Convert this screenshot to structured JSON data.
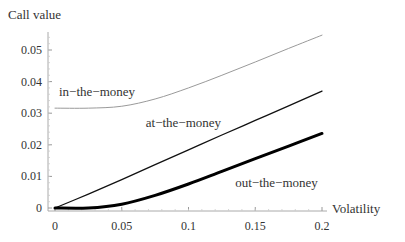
{
  "chart_data": {
    "type": "line",
    "title": "",
    "xlabel": "Volatility",
    "ylabel": "Call value",
    "xlim": [
      0,
      0.2
    ],
    "ylim": [
      0,
      0.055
    ],
    "x_ticks": [
      0,
      0.05,
      0.1,
      0.15,
      0.2
    ],
    "x_tick_labels": [
      "0",
      "0.05",
      "0.1",
      "0.15",
      "0.2"
    ],
    "y_ticks": [
      0,
      0.01,
      0.02,
      0.03,
      0.04,
      0.05
    ],
    "y_tick_labels": [
      "0",
      "0.01",
      "0.02",
      "0.03",
      "0.04",
      "0.05"
    ],
    "grid": false,
    "legend": "none (inline curve labels)",
    "x": [
      0,
      0.025,
      0.05,
      0.075,
      0.1,
      0.125,
      0.15,
      0.175,
      0.2
    ],
    "series": [
      {
        "name": "in-the-money",
        "style": "thin gray",
        "values": [
          0.0316,
          0.0316,
          0.0322,
          0.0345,
          0.038,
          0.042,
          0.0462,
          0.0505,
          0.0547
        ]
      },
      {
        "name": "at-the-money",
        "style": "medium black",
        "values": [
          0.0,
          0.0044,
          0.009,
          0.0137,
          0.0184,
          0.0231,
          0.0277,
          0.0323,
          0.037
        ]
      },
      {
        "name": "out-the-money",
        "style": "thick black",
        "values": [
          0.0,
          0.0,
          0.0012,
          0.004,
          0.0076,
          0.0116,
          0.0156,
          0.0196,
          0.0236
        ]
      }
    ],
    "annotations": [
      {
        "text": "in−the−money",
        "x": 0.003,
        "y": 0.0355
      },
      {
        "text": "at−the−money",
        "x": 0.068,
        "y": 0.0255
      },
      {
        "text": "out−the−money",
        "x": 0.135,
        "y": 0.0068
      }
    ]
  }
}
